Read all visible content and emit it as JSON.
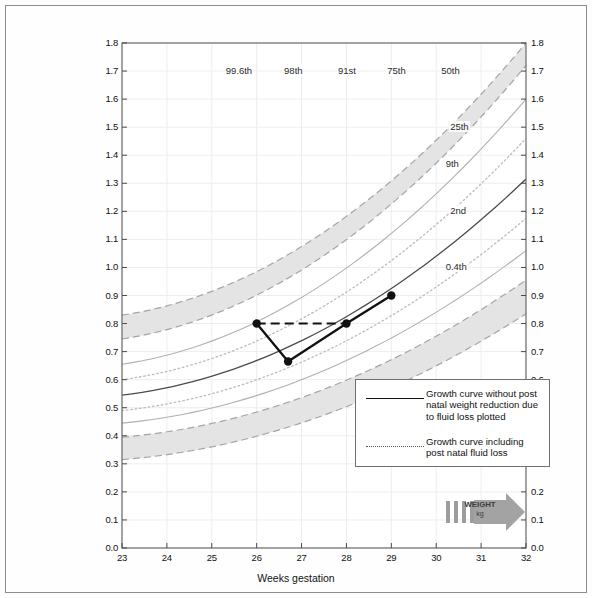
{
  "chart_data": {
    "type": "line",
    "title": "",
    "xlabel": "Weeks gestation",
    "ylabel": "",
    "xlim": [
      23,
      32
    ],
    "ylim": [
      0.0,
      1.8
    ],
    "grid": true,
    "xticks": [
      "23",
      "24",
      "25",
      "26",
      "27",
      "28",
      "29",
      "30",
      "31",
      "32"
    ],
    "yticks": [
      "0.0",
      "0.1",
      "0.2",
      "0.3",
      "0.4",
      "0.5",
      "0.6",
      "0.7",
      "0.8",
      "0.9",
      "1.0",
      "1.1",
      "1.2",
      "1.3",
      "1.4",
      "1.5",
      "1.6",
      "1.7",
      "1.8"
    ],
    "series": [
      {
        "name": "Growth curve without post natal weight reduction due to fluid loss plotted",
        "style": "solid",
        "x": [
          26.0,
          26.7,
          28.0,
          29.0
        ],
        "y": [
          0.8,
          0.665,
          0.8,
          0.9
        ],
        "markers": true
      },
      {
        "name": "Growth curve including post natal fluid loss",
        "style": "dashed",
        "x": [
          26.0,
          28.0
        ],
        "y": [
          0.8,
          0.8
        ],
        "markers": false
      }
    ],
    "reference_curves": [
      {
        "label": "99.6th",
        "style": "band-upper",
        "x": [
          23,
          32
        ],
        "y": [
          0.83,
          1.8
        ]
      },
      {
        "label": "98th",
        "style": "band-lower",
        "x": [
          23,
          32
        ],
        "y": [
          0.745,
          1.72
        ]
      },
      {
        "label": "91st",
        "style": "solid",
        "x": [
          23,
          32
        ],
        "y": [
          0.655,
          1.6
        ]
      },
      {
        "label": "75th",
        "style": "dotted",
        "x": [
          23,
          32
        ],
        "y": [
          0.6,
          1.46
        ]
      },
      {
        "label": "50th",
        "style": "solid-dark",
        "x": [
          23,
          32
        ],
        "y": [
          0.545,
          1.315
        ]
      },
      {
        "label": "25th",
        "style": "dotted",
        "x": [
          23,
          32
        ],
        "y": [
          0.49,
          1.175
        ]
      },
      {
        "label": "9th",
        "style": "solid",
        "x": [
          23,
          32
        ],
        "y": [
          0.445,
          1.06
        ]
      },
      {
        "label": "2nd",
        "style": "band-upper2",
        "x": [
          23,
          32
        ],
        "y": [
          0.395,
          0.955
        ]
      },
      {
        "label": "0.4th",
        "style": "band-lower2",
        "x": [
          23,
          32
        ],
        "y": [
          0.315,
          0.835
        ]
      }
    ],
    "plotted_points": [
      {
        "week": 26.0,
        "weight": 0.8
      },
      {
        "week": 26.7,
        "weight": 0.665
      },
      {
        "week": 28.0,
        "weight": 0.8
      },
      {
        "week": 29.0,
        "weight": 0.9
      }
    ]
  },
  "axes": {
    "x_title": "Weeks gestation",
    "x_labels": [
      "23",
      "24",
      "25",
      "26",
      "27",
      "28",
      "29",
      "30",
      "31",
      "32"
    ],
    "y_labels_left": [
      "1.8",
      "1.7",
      "1.6",
      "1.5",
      "1.4",
      "1.3",
      "1.2",
      "1.1",
      "1.0",
      "0.9",
      "0.8",
      "0.7",
      "0.6",
      "0.5",
      "0.4",
      "0.3",
      "0.2",
      "0.1",
      "0.0"
    ],
    "y_labels_right": [
      "1.8",
      "1.7",
      "1.6",
      "1.5",
      "1.4",
      "1.3",
      "1.2",
      "1.1",
      "1.0",
      "0.9",
      "0.8",
      "0.7",
      "0.6",
      "0.5",
      "0.4",
      "0.3",
      "0.2",
      "0.1",
      "0.0"
    ]
  },
  "percentile_labels": [
    {
      "name": "99.6th"
    },
    {
      "name": "98th"
    },
    {
      "name": "91st"
    },
    {
      "name": "75th"
    },
    {
      "name": "50th"
    },
    {
      "name": "25th"
    },
    {
      "name": "9th"
    },
    {
      "name": "2nd"
    },
    {
      "name": "0.4th"
    }
  ],
  "legend": {
    "entries": [
      {
        "sample": "solid-line",
        "text": "Growth curve without post natal weight reduction due to fluid loss plotted"
      },
      {
        "sample": "dotted-line",
        "text": "Growth curve including post natal fluid loss"
      }
    ]
  },
  "weight_arrow": {
    "label": "WEIGHT",
    "unit": "kg"
  },
  "colors": {
    "band_fill": "#e2e2e2",
    "band_edge": "#9a9a9a",
    "curve_light": "#b7b7b7",
    "curve_dark": "#4a4a4a",
    "plot_line": "#111111",
    "frame": "#8d8d8d",
    "grid": "#ededed",
    "arrow": "#a0a0a0"
  }
}
